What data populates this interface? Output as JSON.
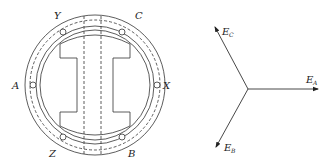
{
  "motor": {
    "terminal_labels": {
      "A": "A",
      "X": "X",
      "Y": "Y",
      "C": "C",
      "Z": "Z",
      "B": "B"
    }
  },
  "phasor": {
    "E_A": {
      "main": "E",
      "sub": "A"
    },
    "E_B": {
      "main": "E",
      "sub": "B"
    },
    "E_C": {
      "main": "E",
      "sub": "C"
    }
  },
  "colors": {
    "stroke": "#333333",
    "text": "#222222",
    "background": "#ffffff"
  }
}
